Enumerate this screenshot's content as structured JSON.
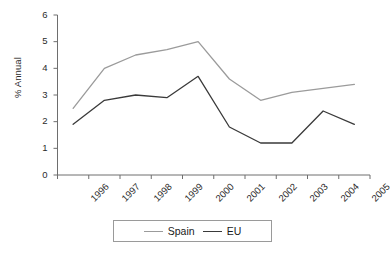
{
  "chart_data": {
    "type": "line",
    "title": "",
    "xlabel": "",
    "ylabel": "% Annual",
    "categories": [
      "1996",
      "1997",
      "1998",
      "1999",
      "2000",
      "2001",
      "2002",
      "2003",
      "2004",
      "2005"
    ],
    "ylim": [
      0,
      6
    ],
    "yticks": [
      0,
      1,
      2,
      3,
      4,
      5,
      6
    ],
    "grid": false,
    "legend_position": "bottom",
    "series": [
      {
        "name": "Spain",
        "color": "#9b9b9b",
        "values": [
          2.5,
          4.0,
          4.5,
          4.7,
          5.0,
          3.6,
          2.8,
          3.1,
          3.25,
          3.4
        ]
      },
      {
        "name": "EU",
        "color": "#3a3a3a",
        "values": [
          1.9,
          2.8,
          3.0,
          2.9,
          3.7,
          1.8,
          1.2,
          1.2,
          2.4,
          1.9
        ]
      }
    ]
  },
  "axis": {
    "y_label": "% Annual",
    "y_tick_labels": [
      "0",
      "1",
      "2",
      "3",
      "4",
      "5",
      "6"
    ],
    "x_tick_labels": [
      "1996",
      "1997",
      "1998",
      "1999",
      "2000",
      "2001",
      "2002",
      "2003",
      "2004",
      "2005"
    ]
  },
  "legend": {
    "items": [
      {
        "label": "Spain",
        "color": "#9b9b9b"
      },
      {
        "label": "EU",
        "color": "#3a3a3a"
      }
    ]
  }
}
